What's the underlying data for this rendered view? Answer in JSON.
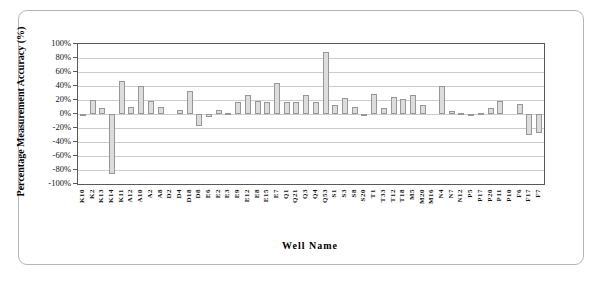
{
  "figure": {
    "background": "#ffffff",
    "border_color": "#b5b5b5"
  },
  "chart_data": {
    "type": "bar",
    "title": "",
    "xlabel": "Well Name",
    "ylabel": "Percentage Measurement Accuracy (%)",
    "ylim": [
      -100,
      100
    ],
    "ytick_step": 20,
    "ytick_labels": [
      "100%",
      "80%",
      "60%",
      "40%",
      "20%",
      "0%",
      "-20%",
      "-40%",
      "-60%",
      "-80%",
      "-100%"
    ],
    "grid": true,
    "legend": "none",
    "bar_fill": "#dcdcdc",
    "bar_border": "#979797",
    "categories": [
      "K10",
      "K2",
      "K13",
      "K14",
      "K11",
      "A12",
      "A10",
      "A2",
      "A8",
      "D2",
      "D4",
      "D18",
      "D8",
      "E6",
      "E2",
      "E3",
      "E9",
      "E12",
      "E8",
      "E15",
      "E7",
      "Q1",
      "Q21",
      "Q3",
      "Q4",
      "Q53",
      "S1",
      "S3",
      "S8",
      "S20",
      "T1",
      "T33",
      "T12",
      "T18",
      "M5",
      "M20",
      "M16",
      "N4",
      "N7",
      "N12",
      "P5",
      "P17",
      "P20",
      "P11",
      "P10",
      "F6",
      "F17",
      "F7"
    ],
    "values": [
      -2,
      20,
      8,
      -85,
      47,
      10,
      40,
      19,
      10,
      0,
      6,
      33,
      -17,
      -4,
      6,
      1,
      17,
      27,
      19,
      17,
      45,
      17,
      17,
      27,
      17,
      89,
      13,
      23,
      10,
      -1,
      28,
      8,
      24,
      21,
      27,
      13,
      0,
      40,
      5,
      2,
      -1,
      1,
      8,
      19,
      0,
      15,
      -30,
      -27
    ]
  }
}
